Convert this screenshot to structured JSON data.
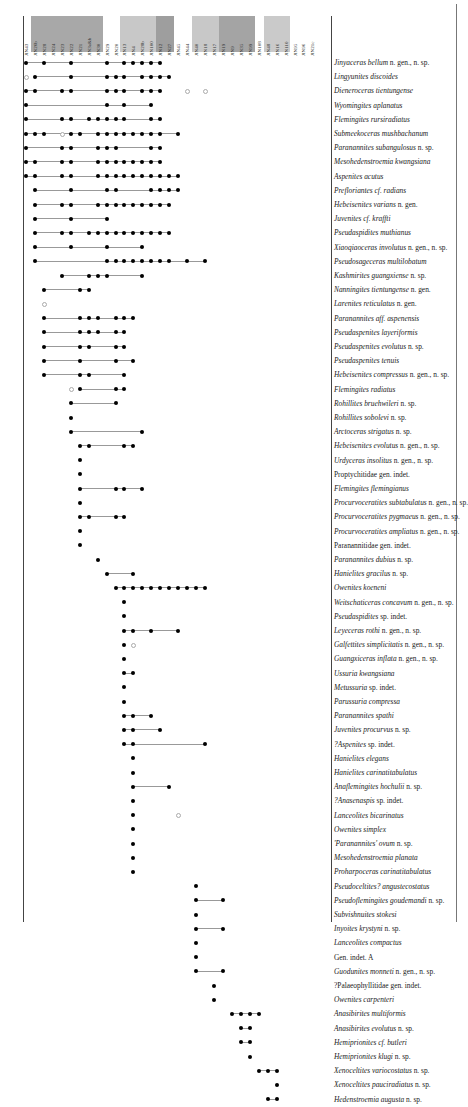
{
  "chart_data": {
    "type": "range_chart",
    "title": "",
    "xlabel": "Samples / beds",
    "ylabel": "Taxa",
    "columns": [
      "JIN43",
      "JIN26b",
      "JIN28",
      "JIN24",
      "JIN23",
      "JIN22",
      "JIN21",
      "JIN3a&b",
      "JIN30",
      "JIN29",
      "JIN20",
      "JIN13",
      "JIN4",
      "JIN28b",
      "JIN100",
      "JIN12",
      "JIN27",
      "JIN45",
      "JIN44",
      "JIN40",
      "JIN18",
      "JIN17",
      "JIN19",
      "JIN9",
      "JIN35",
      "JIN99",
      "JIN108",
      "JIN48",
      "JIN16",
      "JIN110",
      "JIN95",
      "JIN96",
      "JIN21c"
    ],
    "column_shading": [
      {
        "from": 1,
        "to": 8,
        "color": "#a8a8a8"
      },
      {
        "from": 11,
        "to": 14,
        "color": "#c8c8c8"
      },
      {
        "from": 15,
        "to": 16,
        "color": "#9e9e9e"
      },
      {
        "from": 19,
        "to": 21,
        "color": "#c8c8c8"
      },
      {
        "from": 22,
        "to": 25,
        "color": "#a4a4a4"
      },
      {
        "from": 27,
        "to": 29,
        "color": "#cacaca"
      }
    ],
    "legend": {
      "filled_dot": "occurrence",
      "open_dot": "uncertain occurrence",
      "line": "range"
    },
    "rows": [
      {
        "name": "Jinyaceras bellum",
        "suffix": " n. gen., n. sp.",
        "italic": true,
        "dots": [
          0,
          2,
          5,
          9,
          11,
          12,
          13,
          14,
          15
        ],
        "open": []
      },
      {
        "name": "Lingyunites discoides",
        "suffix": "",
        "italic": true,
        "dots": [
          1,
          5,
          9,
          10,
          11,
          13,
          14,
          15,
          16
        ],
        "open": [
          0
        ]
      },
      {
        "name": "Dieneroceras tientungense",
        "suffix": "",
        "italic": true,
        "dots": [
          0,
          1,
          4,
          5,
          9,
          10,
          11,
          13,
          14,
          15
        ],
        "open": [
          18,
          20
        ]
      },
      {
        "name": "Wyomingites aplanatus",
        "suffix": "",
        "italic": true,
        "dots": [
          0,
          9,
          11,
          14
        ],
        "open": []
      },
      {
        "name": "Flemingites rursiradiatus",
        "suffix": "",
        "italic": true,
        "dots": [
          0,
          4,
          5,
          7,
          8,
          9,
          10,
          11,
          14,
          15
        ],
        "open": []
      },
      {
        "name": "Submeekoceras mushbachanum",
        "suffix": "",
        "italic": true,
        "dots": [
          0,
          1,
          2,
          5,
          6,
          8,
          9,
          10,
          11,
          12,
          13,
          14,
          15,
          17
        ],
        "open": [
          4
        ]
      },
      {
        "name": "Paranannites subangulosus",
        "suffix": " n. sp.",
        "italic": true,
        "dots": [
          0,
          4,
          5,
          8,
          9,
          10,
          14,
          15
        ],
        "open": []
      },
      {
        "name": "Mesohedenstroemia kwangsiana",
        "suffix": "",
        "italic": true,
        "dots": [
          0,
          1,
          4,
          5,
          8,
          9,
          10,
          11,
          12,
          13,
          14,
          15
        ],
        "open": []
      },
      {
        "name": "Aspenites acutus",
        "suffix": "",
        "italic": true,
        "dots": [
          0,
          1,
          4,
          5,
          8,
          9,
          10,
          11,
          12,
          13,
          14,
          15,
          16,
          17
        ],
        "open": []
      },
      {
        "name": "Prefloriantes cf. radians",
        "suffix": "",
        "italic": true,
        "dots": [
          1,
          5,
          9,
          10,
          14,
          15,
          16,
          17
        ],
        "open": []
      },
      {
        "name": "Hebeisenites varians",
        "suffix": " n. gen.",
        "italic": true,
        "dots": [
          1,
          4,
          5,
          8,
          9,
          10,
          11,
          12,
          13,
          14,
          15,
          16
        ],
        "open": []
      },
      {
        "name": "Juvenites cf. kraffti",
        "suffix": "",
        "italic": true,
        "dots": [
          1,
          5,
          9
        ],
        "open": []
      },
      {
        "name": "Pseudaspidites muthianus",
        "suffix": "",
        "italic": true,
        "dots": [
          1,
          4,
          5,
          7,
          8,
          9,
          10,
          11,
          12,
          13,
          14,
          15,
          16
        ],
        "open": []
      },
      {
        "name": "Xiaoqiaoceras involutus",
        "suffix": " n. gen., n. sp.",
        "italic": true,
        "dots": [
          1,
          5,
          9,
          13
        ],
        "open": []
      },
      {
        "name": "Pseudosageceras multilobatum",
        "suffix": "",
        "italic": true,
        "dots": [
          1,
          9,
          10,
          11,
          12,
          13,
          14,
          15,
          16,
          18,
          20
        ],
        "open": []
      },
      {
        "name": "Kashmirites guangxiense",
        "suffix": " n. sp.",
        "italic": true,
        "dots": [
          4,
          7,
          8,
          9,
          13
        ],
        "open": []
      },
      {
        "name": "Nanningites tientungense",
        "suffix": " n. gen.",
        "italic": true,
        "dots": [
          2,
          6,
          7
        ],
        "open": []
      },
      {
        "name": "Larenites reticulatus",
        "suffix": " n. gen.",
        "italic": true,
        "dots": [],
        "open": [
          2
        ]
      },
      {
        "name": "Paranannites aff. aspenensis",
        "suffix": "",
        "italic": true,
        "dots": [
          2,
          6,
          7,
          8,
          10,
          11,
          12
        ],
        "open": []
      },
      {
        "name": "Pseudaspenites layeriformis",
        "suffix": "",
        "italic": true,
        "dots": [
          2,
          6,
          7,
          8,
          10,
          11
        ],
        "open": []
      },
      {
        "name": "Pseudaspenites evolutus",
        "suffix": " n. sp.",
        "italic": true,
        "dots": [
          2,
          6,
          7,
          10,
          11
        ],
        "open": []
      },
      {
        "name": "Pseudaspenites tenuis",
        "suffix": "",
        "italic": true,
        "dots": [
          2,
          6,
          10,
          12
        ],
        "open": []
      },
      {
        "name": "Hebeisenites compressus",
        "suffix": " n. gen., n. sp.",
        "italic": true,
        "dots": [
          2,
          6,
          7,
          11
        ],
        "open": []
      },
      {
        "name": "Flemingites radiatus",
        "suffix": "",
        "italic": true,
        "dots": [
          6,
          10,
          11
        ],
        "open": [
          5
        ]
      },
      {
        "name": "Rohillites bruehwileri",
        "suffix": " n. sp.",
        "italic": true,
        "dots": [
          5,
          10
        ],
        "open": []
      },
      {
        "name": "Rohillites sobolevi",
        "suffix": " n. sp.",
        "italic": true,
        "dots": [
          5
        ],
        "open": []
      },
      {
        "name": "Arctoceras strigatus",
        "suffix": " n. sp.",
        "italic": true,
        "dots": [
          5,
          13
        ],
        "open": []
      },
      {
        "name": "Hebeisenites evolutus",
        "suffix": " n. gen., n. sp.",
        "italic": true,
        "dots": [
          6,
          7,
          11,
          12
        ],
        "open": []
      },
      {
        "name": "Urdyceras insolitus",
        "suffix": " n. gen., n. sp.",
        "italic": true,
        "dots": [
          6
        ],
        "open": []
      },
      {
        "name": "Proptychitidae",
        "suffix": " gen. indet.",
        "italic": false,
        "dots": [
          6
        ],
        "open": []
      },
      {
        "name": "Flemingites flemingianus",
        "suffix": "",
        "italic": true,
        "dots": [
          6,
          10,
          11,
          13
        ],
        "open": []
      },
      {
        "name": "Procurvoceratites subtabulatus",
        "suffix": " n. gen., n. sp.",
        "italic": true,
        "dots": [
          6
        ],
        "open": []
      },
      {
        "name": "Procurvoceratites pygmaeus",
        "suffix": " n. gen., n. sp.",
        "italic": true,
        "dots": [
          6,
          7,
          10,
          11
        ],
        "open": []
      },
      {
        "name": "Procurvoceratites ampliatus",
        "suffix": " n. gen., n. sp.",
        "italic": true,
        "dots": [
          6
        ],
        "open": []
      },
      {
        "name": "Paranannitidae",
        "suffix": " gen. indet.",
        "italic": false,
        "dots": [
          6
        ],
        "open": []
      },
      {
        "name": "Paranannites dubius",
        "suffix": " n. sp.",
        "italic": true,
        "dots": [
          8
        ],
        "open": []
      },
      {
        "name": "Hanielites gracilus",
        "suffix": " n. sp.",
        "italic": true,
        "dots": [
          9,
          12
        ],
        "open": []
      },
      {
        "name": "Owenites koeneni",
        "suffix": "",
        "italic": true,
        "dots": [
          10,
          11,
          12,
          13,
          14,
          15,
          16,
          17,
          18,
          19,
          20
        ],
        "open": []
      },
      {
        "name": "Weitschaticeras concavum",
        "suffix": " n. gen., n. sp.",
        "italic": true,
        "dots": [
          11
        ],
        "open": []
      },
      {
        "name": "Pseudaspidites",
        "suffix": " sp. indet.",
        "italic": true,
        "dots": [
          11
        ],
        "open": []
      },
      {
        "name": "Leyeceras rothi",
        "suffix": " n. gen., n. sp.",
        "italic": true,
        "dots": [
          11,
          12,
          14,
          17
        ],
        "open": []
      },
      {
        "name": "Galfettites simplicitatis",
        "suffix": " n. gen., n. sp.",
        "italic": true,
        "dots": [
          11
        ],
        "open": [
          12
        ]
      },
      {
        "name": "Guangxiceras inflata",
        "suffix": " n. gen., n. sp.",
        "italic": true,
        "dots": [
          11
        ],
        "open": []
      },
      {
        "name": "Ussuria kwangsiana",
        "suffix": "",
        "italic": true,
        "dots": [
          11,
          12
        ],
        "open": []
      },
      {
        "name": "Metussuria",
        "suffix": " sp. indet.",
        "italic": true,
        "dots": [
          11
        ],
        "open": []
      },
      {
        "name": "Parussuria compressa",
        "suffix": "",
        "italic": true,
        "dots": [
          11
        ],
        "open": []
      },
      {
        "name": "Paranannites spathi",
        "suffix": "",
        "italic": true,
        "dots": [
          11,
          12,
          14
        ],
        "open": []
      },
      {
        "name": "Juvenites procurvus",
        "suffix": " n. sp.",
        "italic": true,
        "dots": [
          11,
          12,
          15
        ],
        "open": []
      },
      {
        "name": "?Aspenites",
        "suffix": " sp. indet.",
        "italic": true,
        "dots": [
          11,
          12,
          20
        ],
        "open": []
      },
      {
        "name": "Hanielites elegans",
        "suffix": "",
        "italic": true,
        "dots": [
          12
        ],
        "open": []
      },
      {
        "name": "Hanielites carinatitabulatus",
        "suffix": "",
        "italic": true,
        "dots": [
          12
        ],
        "open": []
      },
      {
        "name": "Anaflemingites hochulii",
        "suffix": " n. sp.",
        "italic": true,
        "dots": [
          12,
          16
        ],
        "open": []
      },
      {
        "name": "?Anasenaspis",
        "suffix": " sp. indet.",
        "italic": true,
        "dots": [
          12
        ],
        "open": []
      },
      {
        "name": "Lanceolites bicarinatus",
        "suffix": "",
        "italic": true,
        "dots": [
          12
        ],
        "open": [
          17
        ]
      },
      {
        "name": "Owenites simplex",
        "suffix": "",
        "italic": true,
        "dots": [
          12
        ],
        "open": []
      },
      {
        "name": "'Paranannites' ovum",
        "suffix": " n. sp.",
        "italic": true,
        "dots": [
          12
        ],
        "open": []
      },
      {
        "name": "Mesohedenstroemia planata",
        "suffix": "",
        "italic": true,
        "dots": [
          12
        ],
        "open": []
      },
      {
        "name": "Proharpoceras carinatitabulatus",
        "suffix": "",
        "italic": true,
        "dots": [
          12
        ],
        "open": []
      },
      {
        "name": "Pseudoceltites? angustecostatus",
        "suffix": "",
        "italic": true,
        "dots": [
          19
        ],
        "open": []
      },
      {
        "name": "Pseudoflemingites goudemandi",
        "suffix": " n. sp.",
        "italic": true,
        "dots": [
          19,
          22
        ],
        "open": []
      },
      {
        "name": "Subvishnuites stokesi",
        "suffix": "",
        "italic": true,
        "dots": [
          19
        ],
        "open": []
      },
      {
        "name": "Inyoites krystyni",
        "suffix": " n. sp.",
        "italic": true,
        "dots": [
          19,
          22
        ],
        "open": []
      },
      {
        "name": "Lanceolites compactus",
        "suffix": "",
        "italic": true,
        "dots": [
          19
        ],
        "open": []
      },
      {
        "name": "Gen. indet. A",
        "suffix": "",
        "italic": false,
        "dots": [
          19
        ],
        "open": []
      },
      {
        "name": "Guodunites monneti",
        "suffix": " n. gen., n. sp.",
        "italic": true,
        "dots": [
          19,
          22
        ],
        "open": []
      },
      {
        "name": "?Palaeophyllitidae",
        "suffix": " gen. indet.",
        "italic": false,
        "dots": [
          21
        ],
        "open": []
      },
      {
        "name": "Owenites carpenteri",
        "suffix": "",
        "italic": true,
        "dots": [
          21
        ],
        "open": []
      },
      {
        "name": "Anasibirites multiformis",
        "suffix": "",
        "italic": true,
        "dots": [
          23,
          24,
          25,
          26
        ],
        "open": []
      },
      {
        "name": "Anasibirites evolutus",
        "suffix": " n. sp.",
        "italic": true,
        "dots": [
          24,
          25
        ],
        "open": []
      },
      {
        "name": "Hemiprionites cf. butleri",
        "suffix": "",
        "italic": true,
        "dots": [
          24,
          25
        ],
        "open": []
      },
      {
        "name": "Hemiprionites klugi",
        "suffix": " n. sp.",
        "italic": true,
        "dots": [
          25
        ],
        "open": []
      },
      {
        "name": "Xenoceltites variocostatus",
        "suffix": " n. sp.",
        "italic": true,
        "dots": [
          26,
          27,
          28
        ],
        "open": []
      },
      {
        "name": "Xenoceltites pauciradiatus",
        "suffix": " n. sp.",
        "italic": true,
        "dots": [
          28
        ],
        "open": []
      },
      {
        "name": "Hedenstroemia augusta",
        "suffix": " n. sp.",
        "italic": true,
        "dots": [
          27,
          28
        ],
        "open": []
      }
    ]
  }
}
